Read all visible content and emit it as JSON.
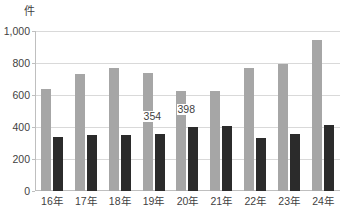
{
  "title_strip": "",
  "unit_label": "件",
  "chart_data": {
    "type": "bar",
    "title": "",
    "subtitle": "",
    "xlabel": "",
    "ylabel": "件",
    "ylim": [
      0,
      1000
    ],
    "ytick_values": [
      0,
      200,
      400,
      600,
      800,
      1000
    ],
    "ytick_labels": [
      "0",
      "200",
      "400",
      "600",
      "800",
      "1,000"
    ],
    "grid": true,
    "legend": "none",
    "categories": [
      "16年",
      "17年",
      "18年",
      "19年",
      "20年",
      "21年",
      "22年",
      "23年",
      "24年"
    ],
    "series": [
      {
        "name": "series-gray",
        "color": "#a6a6a6",
        "values": [
          638,
          731,
          769,
          738,
          625,
          625,
          769,
          794,
          944
        ]
      },
      {
        "name": "series-dark",
        "color": "#2b2b2b",
        "values": [
          340,
          350,
          350,
          354,
          398,
          408,
          333,
          359,
          414
        ]
      }
    ],
    "annotations": [
      {
        "text": "354",
        "series": "series-dark",
        "category": "19年",
        "value": 354
      },
      {
        "text": "398",
        "series": "series-dark",
        "category": "20年",
        "value": 398
      }
    ]
  }
}
